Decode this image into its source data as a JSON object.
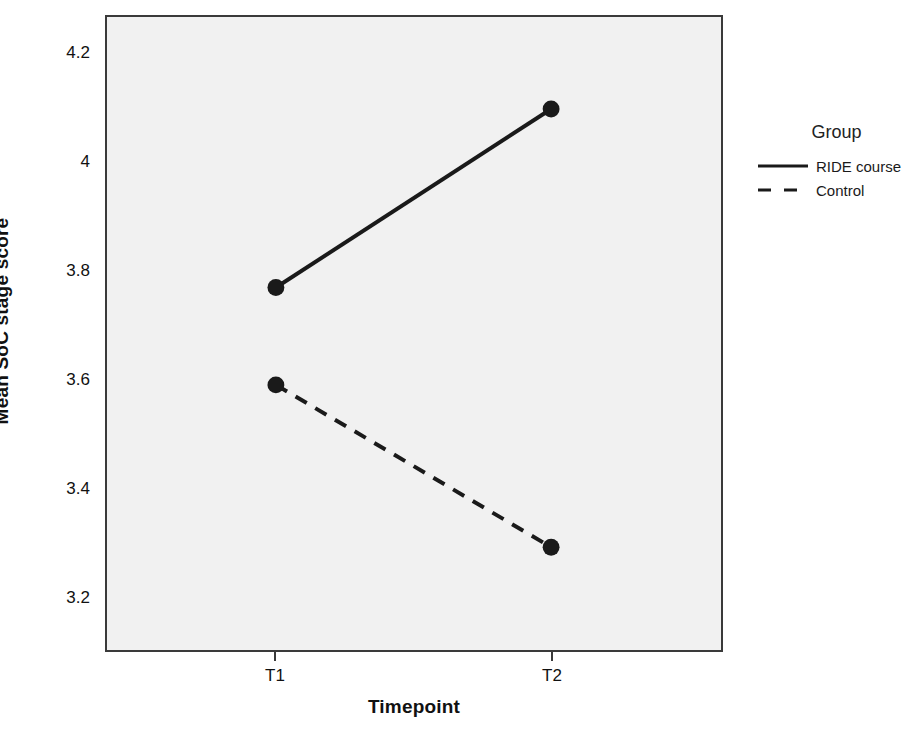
{
  "chart_data": {
    "type": "line",
    "title": "",
    "xlabel": "Timepoint",
    "ylabel": "Mean SoC stage score",
    "categories": [
      "T1",
      "T2"
    ],
    "x_tick_labels": [
      "T1",
      "T2"
    ],
    "y_tick_labels": [
      "4.2",
      "4",
      "3.8",
      "3.6",
      "3.4",
      "3.2"
    ],
    "y_tick_values": [
      4.2,
      4.0,
      3.8,
      3.6,
      3.4,
      3.2
    ],
    "ylim": [
      3.1,
      4.27
    ],
    "xlim": [
      0,
      1
    ],
    "grid": false,
    "legend_position": "right",
    "legend_title": "Group",
    "series": [
      {
        "name": "RIDE course",
        "values": [
          3.77,
          4.1
        ],
        "linestyle": "solid",
        "marker": "circle",
        "color": "#1a1a1a"
      },
      {
        "name": "Control",
        "values": [
          3.59,
          3.29
        ],
        "linestyle": "dashed",
        "marker": "circle",
        "color": "#1a1a1a"
      }
    ]
  },
  "axes": {
    "y_title": "Mean SoC stage score",
    "x_title": "Timepoint",
    "y_ticks": [
      {
        "label": "4.2"
      },
      {
        "label": "4"
      },
      {
        "label": "3.8"
      },
      {
        "label": "3.6"
      },
      {
        "label": "3.4"
      },
      {
        "label": "3.2"
      }
    ],
    "x_ticks": [
      {
        "label": "T1"
      },
      {
        "label": "T2"
      }
    ]
  },
  "legend": {
    "title": "Group",
    "entries": [
      {
        "label": "RIDE course",
        "style": "solid"
      },
      {
        "label": "Control",
        "style": "dashed"
      }
    ]
  },
  "colors": {
    "line": "#1a1a1a",
    "frame": "#3a3a3a",
    "plot_background": "#f1f1f1",
    "page_background": "#ffffff",
    "text": "#111111"
  }
}
